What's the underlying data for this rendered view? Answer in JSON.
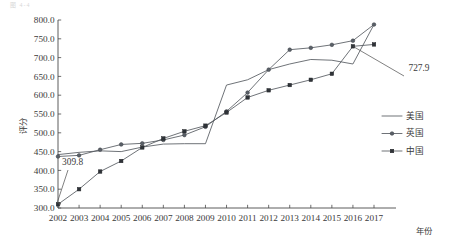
{
  "page": {
    "top_note": "图 4-4"
  },
  "chart_data": {
    "type": "line",
    "title": "",
    "xlabel": "年份",
    "ylabel": "评分",
    "grid": false,
    "legend_position": "right",
    "categories": [
      "2002",
      "2003",
      "2004",
      "2005",
      "2006",
      "2007",
      "2008",
      "2009",
      "2010",
      "2011",
      "2012",
      "2013",
      "2014",
      "2015",
      "2016",
      "2017"
    ],
    "x": [
      2002,
      2003,
      2004,
      2005,
      2006,
      2007,
      2008,
      2009,
      2010,
      2011,
      2012,
      2013,
      2014,
      2015,
      2016,
      2017
    ],
    "xlim": [
      2002,
      2017
    ],
    "ylim": [
      300.0,
      800.0
    ],
    "ytick_labels": [
      "300.0",
      "350.0",
      "400.0",
      "450.0",
      "500.0",
      "550.0",
      "600.0",
      "650.0",
      "700.0",
      "750.0",
      "800.0"
    ],
    "yticks": [
      300.0,
      350.0,
      400.0,
      450.0,
      500.0,
      550.0,
      600.0,
      650.0,
      700.0,
      750.0,
      800.0
    ],
    "series": [
      {
        "name": "美国",
        "marker": "none",
        "values": [
          442.0,
          448.0,
          452.0,
          450.0,
          462.0,
          470.0,
          471.0,
          471.0,
          627.0,
          641.0,
          668.0,
          683.0,
          695.0,
          693.0,
          683.0,
          788.0
        ]
      },
      {
        "name": "英国",
        "marker": "circle",
        "values": [
          437.0,
          440.0,
          455.0,
          469.0,
          472.0,
          481.0,
          494.0,
          516.0,
          557.0,
          607.0,
          668.0,
          721.0,
          726.0,
          734.0,
          745.0,
          788.0
        ]
      },
      {
        "name": "中国",
        "marker": "square",
        "values": [
          309.8,
          350.0,
          397.0,
          425.0,
          461.0,
          485.0,
          504.0,
          519.0,
          554.0,
          594.0,
          613.0,
          627.0,
          641.0,
          657.0,
          730.0,
          735.0
        ]
      }
    ],
    "annotations": [
      {
        "label": "309.8",
        "series": "中国",
        "x": 2002,
        "y": 309.8
      },
      {
        "label": "727.9",
        "series": "中国",
        "x": 2016,
        "y": 730.0
      }
    ]
  },
  "legend": {
    "items": [
      {
        "label": "美国",
        "marker": "none"
      },
      {
        "label": "英国",
        "marker": "circle"
      },
      {
        "label": "中国",
        "marker": "square"
      }
    ]
  }
}
